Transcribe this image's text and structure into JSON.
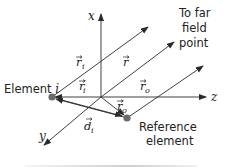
{
  "diagram": {
    "axes": {
      "x": "x",
      "y": "y",
      "z": "z"
    },
    "labels": {
      "far_field_line1": "To far",
      "far_field_line2": "field",
      "far_field_line3": "point",
      "element_i": "Element ",
      "element_i_index": "i",
      "reference_line1": "Reference",
      "reference_line2": "element"
    },
    "vectors": {
      "r_i": {
        "symbol": "r",
        "sub": "i",
        "prime": ""
      },
      "r": {
        "symbol": "r",
        "sub": "",
        "prime": ""
      },
      "r_i_prime": {
        "symbol": "r",
        "sub": "i",
        "prime": "′"
      },
      "r_o": {
        "symbol": "r",
        "sub": "o",
        "prime": ""
      },
      "r_o_prime": {
        "symbol": "r",
        "sub": "o",
        "prime": "′"
      },
      "d_i": {
        "symbol": "d",
        "sub": "i",
        "prime": ""
      }
    },
    "colors": {
      "line": "#2a2a2a",
      "dot": "#6b6b6b",
      "text": "#222222"
    }
  }
}
